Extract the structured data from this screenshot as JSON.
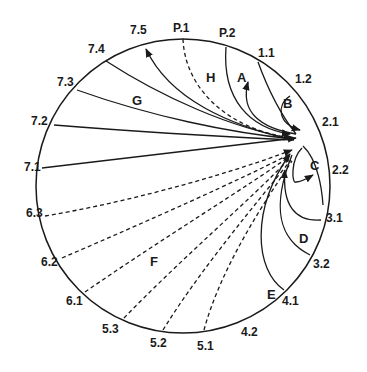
{
  "diagram": {
    "type": "circular-network",
    "circle": {
      "cx": 183,
      "cy": 186,
      "r": 147
    },
    "hub": {
      "x": 298,
      "y": 148
    },
    "perimeter_labels": [
      {
        "id": "p1",
        "text": "P.1",
        "x": 173,
        "y": 32
      },
      {
        "id": "p2",
        "text": "P.2",
        "x": 219,
        "y": 37
      },
      {
        "id": "1.1",
        "text": "1.1",
        "x": 258,
        "y": 57
      },
      {
        "id": "1.2",
        "text": "1.2",
        "x": 295,
        "y": 83
      },
      {
        "id": "2.1",
        "text": "2.1",
        "x": 322,
        "y": 126
      },
      {
        "id": "2.2",
        "text": "2.2",
        "x": 332,
        "y": 174
      },
      {
        "id": "3.1",
        "text": "3.1",
        "x": 326,
        "y": 222
      },
      {
        "id": "3.2",
        "text": "3.2",
        "x": 313,
        "y": 268
      },
      {
        "id": "4.1",
        "text": "4.1",
        "x": 282,
        "y": 305
      },
      {
        "id": "4.2",
        "text": "4.2",
        "x": 241,
        "y": 336
      },
      {
        "id": "5.1",
        "text": "5.1",
        "x": 197,
        "y": 350
      },
      {
        "id": "5.2",
        "text": "5.2",
        "x": 150,
        "y": 347
      },
      {
        "id": "5.3",
        "text": "5.3",
        "x": 102,
        "y": 333
      },
      {
        "id": "6.1",
        "text": "6.1",
        "x": 66,
        "y": 305
      },
      {
        "id": "6.2",
        "text": "6.2",
        "x": 41,
        "y": 266
      },
      {
        "id": "6.3",
        "text": "6.3",
        "x": 26,
        "y": 217
      },
      {
        "id": "7.1",
        "text": "7.1",
        "x": 24,
        "y": 171
      },
      {
        "id": "7.2",
        "text": "7.2",
        "x": 31,
        "y": 125
      },
      {
        "id": "7.3",
        "text": "7.3",
        "x": 57,
        "y": 86
      },
      {
        "id": "7.4",
        "text": "7.4",
        "x": 88,
        "y": 53
      },
      {
        "id": "7.5",
        "text": "7.5",
        "x": 130,
        "y": 34
      }
    ],
    "region_labels": [
      {
        "id": "A",
        "text": "A",
        "x": 237,
        "y": 82
      },
      {
        "id": "B",
        "text": "B",
        "x": 283,
        "y": 108
      },
      {
        "id": "C",
        "text": "C",
        "x": 310,
        "y": 170
      },
      {
        "id": "D",
        "text": "D",
        "x": 299,
        "y": 243
      },
      {
        "id": "E",
        "text": "E",
        "x": 267,
        "y": 299
      },
      {
        "id": "F",
        "text": "F",
        "x": 150,
        "y": 266
      },
      {
        "id": "G",
        "text": "G",
        "x": 132,
        "y": 105
      },
      {
        "id": "H",
        "text": "H",
        "x": 206,
        "y": 82
      }
    ],
    "edges": [
      {
        "from": "7.1",
        "to": "hub",
        "style": "solid",
        "arrow": true
      },
      {
        "from": "7.2",
        "to": "hub",
        "style": "solid",
        "arrow": false
      },
      {
        "from": "7.3",
        "to": "hub",
        "style": "solid",
        "arrow": false
      },
      {
        "from": "7.4",
        "to": "hub",
        "style": "solid",
        "arrow": false
      },
      {
        "from": "hub",
        "to": "7.5",
        "style": "solid",
        "arrow": true
      },
      {
        "from": "P.1",
        "to": "hub",
        "style": "dashed",
        "arrow": true
      },
      {
        "from": "P.2",
        "to": "hub",
        "style": "solid",
        "arrow": true
      },
      {
        "from": "hub",
        "to": "1.1",
        "style": "solid",
        "arrow": true,
        "region": "A"
      },
      {
        "from": "1.2",
        "to": "2.1",
        "style": "solid",
        "arrow": true,
        "region": "B"
      },
      {
        "from": "hub",
        "to": "2.2",
        "style": "solid",
        "arrow": true,
        "region": "C"
      },
      {
        "from": "3.1",
        "to": "hub",
        "style": "solid",
        "arrow": true,
        "region": "D"
      },
      {
        "from": "3.2",
        "to": "hub",
        "style": "solid",
        "arrow": false,
        "region": "D"
      },
      {
        "from": "4.1",
        "to": "hub",
        "style": "solid",
        "arrow": true,
        "region": "E"
      },
      {
        "from": "5.1",
        "to": "hub",
        "style": "dashed",
        "arrow": false
      },
      {
        "from": "5.2",
        "to": "hub",
        "style": "dashed",
        "arrow": false
      },
      {
        "from": "5.3",
        "to": "hub",
        "style": "dashed",
        "arrow": false
      },
      {
        "from": "6.1",
        "to": "hub",
        "style": "dashed",
        "arrow": false
      },
      {
        "from": "6.2",
        "to": "hub",
        "style": "dashed",
        "arrow": false
      },
      {
        "from": "6.3",
        "to": "hub",
        "style": "dashed",
        "arrow": true
      }
    ]
  }
}
